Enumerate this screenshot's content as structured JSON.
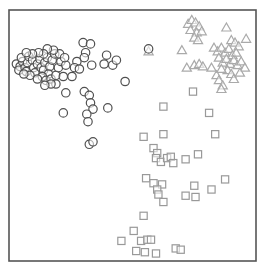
{
  "chart_data": {
    "type": "scatter",
    "title": "",
    "xlabel": "",
    "ylabel": "",
    "xlim": [
      0,
      100
    ],
    "ylim": [
      0,
      100
    ],
    "grid": false,
    "axes_ticks": false,
    "legend": null,
    "series": [
      {
        "name": "circles",
        "marker": "circle",
        "color": "#505050",
        "points": [
          [
            3.0,
            78.5
          ],
          [
            4.5,
            77.5
          ],
          [
            5.5,
            79.5
          ],
          [
            4.0,
            76.0
          ],
          [
            6.5,
            77.0
          ],
          [
            7.5,
            79.0
          ],
          [
            5.0,
            81.0
          ],
          [
            8.0,
            81.5
          ],
          [
            9.5,
            80.0
          ],
          [
            7.0,
            75.5
          ],
          [
            10.0,
            77.0
          ],
          [
            11.5,
            78.5
          ],
          [
            12.5,
            80.5
          ],
          [
            10.5,
            75.0
          ],
          [
            8.5,
            74.0
          ],
          [
            6.0,
            74.5
          ],
          [
            13.0,
            77.0
          ],
          [
            14.5,
            79.0
          ],
          [
            15.5,
            81.0
          ],
          [
            14.0,
            76.0
          ],
          [
            16.5,
            77.5
          ],
          [
            17.5,
            80.0
          ],
          [
            18.5,
            82.5
          ],
          [
            16.0,
            74.5
          ],
          [
            13.5,
            73.5
          ],
          [
            11.5,
            72.5
          ],
          [
            15.0,
            72.0
          ],
          [
            17.0,
            72.5
          ],
          [
            19.0,
            74.0
          ],
          [
            20.0,
            77.0
          ],
          [
            21.0,
            79.5
          ],
          [
            20.5,
            82.5
          ],
          [
            18.0,
            84.0
          ],
          [
            15.5,
            84.5
          ],
          [
            14.0,
            82.5
          ],
          [
            12.0,
            83.0
          ],
          [
            9.5,
            82.5
          ],
          [
            7.0,
            83.0
          ],
          [
            19.0,
            70.5
          ],
          [
            17.0,
            70.5
          ],
          [
            14.5,
            70.0
          ],
          [
            22.0,
            73.5
          ],
          [
            23.0,
            78.0
          ],
          [
            22.5,
            81.0
          ],
          [
            27.5,
            79.5
          ],
          [
            26.5,
            77.0
          ],
          [
            28.5,
            76.5
          ],
          [
            25.5,
            73.5
          ],
          [
            23.0,
            67.0
          ],
          [
            30.0,
            87.0
          ],
          [
            33.0,
            86.5
          ],
          [
            31.0,
            83.0
          ],
          [
            30.5,
            81.0
          ],
          [
            33.5,
            78.0
          ],
          [
            39.5,
            82.0
          ],
          [
            38.5,
            78.5
          ],
          [
            42.0,
            78.0
          ],
          [
            43.5,
            80.0
          ],
          [
            47.0,
            71.5
          ],
          [
            30.5,
            67.5
          ],
          [
            32.5,
            66.0
          ],
          [
            33.0,
            63.0
          ],
          [
            34.0,
            60.5
          ],
          [
            31.5,
            58.5
          ],
          [
            32.0,
            55.5
          ],
          [
            40.0,
            61.0
          ],
          [
            22.0,
            59.0
          ],
          [
            32.5,
            46.5
          ],
          [
            34.0,
            47.5
          ],
          [
            56.5,
            84.5
          ]
        ]
      },
      {
        "name": "triangles",
        "marker": "triangle",
        "color": "#aaaaaa",
        "points": [
          [
            72.5,
            94.5
          ],
          [
            74.0,
            96.0
          ],
          [
            75.5,
            95.0
          ],
          [
            77.0,
            93.5
          ],
          [
            73.5,
            92.0
          ],
          [
            76.0,
            91.0
          ],
          [
            78.0,
            91.5
          ],
          [
            75.0,
            89.0
          ],
          [
            76.5,
            88.0
          ],
          [
            56.5,
            83.5
          ],
          [
            70.0,
            84.0
          ],
          [
            88.0,
            93.0
          ],
          [
            96.0,
            88.5
          ],
          [
            90.0,
            88.0
          ],
          [
            91.5,
            87.0
          ],
          [
            93.0,
            85.5
          ],
          [
            83.0,
            85.0
          ],
          [
            84.5,
            83.5
          ],
          [
            86.0,
            85.0
          ],
          [
            87.5,
            83.0
          ],
          [
            89.0,
            84.5
          ],
          [
            90.5,
            82.0
          ],
          [
            92.0,
            83.0
          ],
          [
            85.0,
            81.0
          ],
          [
            86.5,
            79.0
          ],
          [
            88.0,
            80.5
          ],
          [
            89.5,
            78.5
          ],
          [
            91.0,
            80.0
          ],
          [
            92.5,
            78.0
          ],
          [
            94.0,
            79.5
          ],
          [
            95.5,
            77.0
          ],
          [
            88.5,
            76.0
          ],
          [
            90.0,
            74.5
          ],
          [
            84.0,
            74.0
          ],
          [
            82.0,
            77.0
          ],
          [
            86.0,
            76.5
          ],
          [
            91.0,
            72.5
          ],
          [
            93.5,
            75.0
          ],
          [
            85.0,
            72.0
          ],
          [
            72.0,
            77.0
          ],
          [
            75.0,
            78.0
          ],
          [
            77.0,
            78.5
          ],
          [
            78.5,
            77.5
          ],
          [
            86.5,
            70.0
          ],
          [
            86.0,
            68.5
          ]
        ]
      },
      {
        "name": "squares",
        "marker": "square",
        "color": "#999999",
        "points": [
          [
            74.5,
            67.5
          ],
          [
            62.5,
            61.5
          ],
          [
            81.0,
            59.0
          ],
          [
            54.5,
            49.5
          ],
          [
            62.5,
            50.5
          ],
          [
            83.5,
            50.5
          ],
          [
            58.5,
            45.0
          ],
          [
            60.0,
            43.0
          ],
          [
            59.5,
            41.0
          ],
          [
            61.5,
            39.5
          ],
          [
            64.0,
            41.0
          ],
          [
            65.5,
            41.5
          ],
          [
            66.5,
            39.0
          ],
          [
            71.5,
            40.5
          ],
          [
            76.5,
            42.5
          ],
          [
            55.5,
            33.0
          ],
          [
            58.5,
            31.0
          ],
          [
            62.0,
            30.5
          ],
          [
            60.0,
            28.5
          ],
          [
            60.5,
            26.5
          ],
          [
            75.0,
            30.0
          ],
          [
            82.0,
            28.5
          ],
          [
            87.5,
            32.5
          ],
          [
            71.5,
            26.0
          ],
          [
            75.5,
            25.5
          ],
          [
            62.5,
            23.5
          ],
          [
            54.5,
            18.0
          ],
          [
            50.5,
            12.0
          ],
          [
            45.5,
            8.0
          ],
          [
            53.5,
            8.0
          ],
          [
            56.0,
            8.5
          ],
          [
            57.5,
            8.5
          ],
          [
            51.5,
            4.0
          ],
          [
            55.0,
            3.5
          ],
          [
            59.5,
            3.0
          ],
          [
            67.5,
            5.0
          ],
          [
            69.5,
            4.5
          ]
        ]
      }
    ]
  },
  "style": {
    "frame_color": "#555555",
    "background": "#ffffff"
  }
}
